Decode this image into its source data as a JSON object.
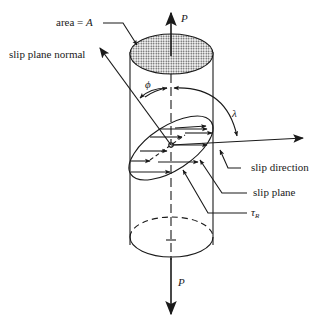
{
  "diagram": {
    "labels": {
      "area": "area = ",
      "area_symbol": "A",
      "load_top": "P",
      "load_bottom": "P",
      "slip_plane_normal": "slip plane normal",
      "phi": "ϕ",
      "lambda": "λ",
      "slip_direction": "slip direction",
      "slip_plane": "slip plane",
      "tau": "τ",
      "tau_subscript": "R"
    },
    "colors": {
      "ink": "#1a1a1a",
      "hatch": "#555555",
      "background": "#ffffff"
    }
  }
}
